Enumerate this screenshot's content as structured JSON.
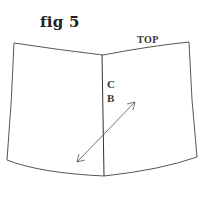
{
  "figure": {
    "title": "fig 5",
    "labels": {
      "top": "TOP",
      "c": "C",
      "b": "B"
    },
    "colors": {
      "stroke": "#444444",
      "background": "#ffffff"
    },
    "shape": {
      "name": "pattern piece",
      "top_edge": {
        "left": [
          14,
          43
        ],
        "center": [
          103,
          55
        ],
        "right": [
          189,
          42
        ]
      },
      "bottom_edge": {
        "left": [
          7,
          160
        ],
        "center": [
          104,
          176
        ],
        "right": [
          197,
          157
        ]
      },
      "center_line": {
        "from": [
          102,
          55
        ],
        "to": [
          104,
          176
        ]
      },
      "grainline_arrow": {
        "from": [
          77,
          162
        ],
        "to": [
          135,
          102
        ],
        "double_headed": true
      }
    }
  }
}
